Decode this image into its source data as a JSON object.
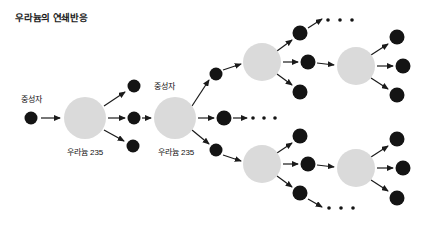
{
  "figure": {
    "title": "우라늄의 연쇄반응",
    "type": "diagram",
    "background_color": "#ffffff",
    "nucleus_color": "#d9d9d9",
    "neutron_color": "#1a1a1a",
    "arrow_color": "#1a1a1a",
    "text_color": "#111111"
  },
  "labels": {
    "neutron_left": "중성자",
    "neutron_top": "중성자",
    "uranium_1": "우라늄 235",
    "uranium_2": "우라늄 235",
    "ellipsis": "· · ·"
  },
  "diagram_data": {
    "generations": 4,
    "branching_factor": 3,
    "nuclei": [
      {
        "id": "u1",
        "cx": 85,
        "cy": 118,
        "r": 21,
        "label": "우라늄 235",
        "label_x": 85,
        "label_y": 152
      },
      {
        "id": "u2",
        "cx": 175,
        "cy": 118,
        "r": 21,
        "label": "우라늄 235",
        "label_x": 175,
        "label_y": 152
      },
      {
        "id": "u3",
        "cx": 262,
        "cy": 62,
        "r": 19,
        "label": "",
        "label_x": 0,
        "label_y": 0
      },
      {
        "id": "u4",
        "cx": 262,
        "cy": 164,
        "r": 19,
        "label": "",
        "label_x": 0,
        "label_y": 0
      },
      {
        "id": "u5",
        "cx": 356,
        "cy": 66,
        "r": 19,
        "label": "",
        "label_x": 0,
        "label_y": 0
      },
      {
        "id": "u6",
        "cx": 356,
        "cy": 168,
        "r": 19,
        "label": "",
        "label_x": 0,
        "label_y": 0
      }
    ],
    "neutrons": [
      {
        "id": "n0",
        "cx": 31,
        "cy": 118,
        "r": 6.5
      },
      {
        "id": "n1",
        "cx": 134,
        "cy": 86,
        "r": 6.5
      },
      {
        "id": "n2",
        "cx": 134,
        "cy": 118,
        "r": 6.5
      },
      {
        "id": "n3",
        "cx": 134,
        "cy": 146,
        "r": 6.5
      },
      {
        "id": "n4",
        "cx": 216,
        "cy": 74,
        "r": 6.5
      },
      {
        "id": "n5",
        "cx": 224,
        "cy": 118,
        "r": 7.5
      },
      {
        "id": "n6",
        "cx": 216,
        "cy": 150,
        "r": 6.5
      },
      {
        "id": "n7",
        "cx": 300,
        "cy": 33,
        "r": 7.5
      },
      {
        "id": "n8",
        "cx": 308,
        "cy": 62,
        "r": 7.5
      },
      {
        "id": "n9",
        "cx": 300,
        "cy": 92,
        "r": 7.5
      },
      {
        "id": "n10",
        "cx": 300,
        "cy": 136,
        "r": 7.5
      },
      {
        "id": "n11",
        "cx": 308,
        "cy": 164,
        "r": 7.5
      },
      {
        "id": "n12",
        "cx": 300,
        "cy": 193,
        "r": 7.5
      },
      {
        "id": "n13",
        "cx": 397,
        "cy": 37,
        "r": 7.5
      },
      {
        "id": "n14",
        "cx": 403,
        "cy": 66,
        "r": 7.5
      },
      {
        "id": "n15",
        "cx": 397,
        "cy": 95,
        "r": 7.5
      },
      {
        "id": "n16",
        "cx": 397,
        "cy": 139,
        "r": 7.5
      },
      {
        "id": "n17",
        "cx": 403,
        "cy": 168,
        "r": 7.5
      },
      {
        "id": "n18",
        "cx": 397,
        "cy": 198,
        "r": 7.5
      }
    ],
    "ellipses_groups": [
      {
        "id": "e-top",
        "x": 327,
        "y": 22,
        "count": 3
      },
      {
        "id": "e-mid",
        "x": 252,
        "y": 118,
        "count": 3
      },
      {
        "id": "e-bottom-mid",
        "x": 252,
        "y": 118,
        "count": 0
      },
      {
        "id": "e-lower",
        "x": 327,
        "y": 205,
        "count": 3
      }
    ],
    "arrows": [
      {
        "from": "n0",
        "to": "u1",
        "x1": 41,
        "y1": 118,
        "x2": 62,
        "y2": 118
      },
      {
        "from": "u1",
        "to": "n1",
        "x1": 103,
        "y1": 105,
        "x2": 126,
        "y2": 91
      },
      {
        "from": "u1",
        "to": "n2",
        "x1": 108,
        "y1": 118,
        "x2": 126,
        "y2": 118
      },
      {
        "from": "u1",
        "to": "n3",
        "x1": 103,
        "y1": 131,
        "x2": 124,
        "y2": 142
      },
      {
        "from": "n2",
        "to": "u2",
        "x1": 142,
        "y1": 118,
        "x2": 152,
        "y2": 118
      },
      {
        "from": "u2",
        "to": "n4",
        "x1": 192,
        "y1": 106,
        "x2": 209,
        "y2": 79
      },
      {
        "from": "u2",
        "to": "n5",
        "x1": 197,
        "y1": 118,
        "x2": 215,
        "y2": 118
      },
      {
        "from": "u2",
        "to": "n6",
        "x1": 192,
        "y1": 131,
        "x2": 209,
        "y2": 145
      },
      {
        "from": "n4",
        "to": "u3",
        "x1": 223,
        "y1": 70,
        "x2": 242,
        "y2": 64
      },
      {
        "from": "n6",
        "to": "u4",
        "x1": 223,
        "y1": 155,
        "x2": 242,
        "y2": 162
      },
      {
        "from": "n5",
        "to": "e-mid",
        "x1": 233,
        "y1": 118,
        "x2": 248,
        "y2": 118
      },
      {
        "from": "u3",
        "to": "n7",
        "x1": 277,
        "y1": 50,
        "x2": 292,
        "y2": 39
      },
      {
        "from": "u3",
        "to": "n8",
        "x1": 283,
        "y1": 62,
        "x2": 299,
        "y2": 62
      },
      {
        "from": "u3",
        "to": "n9",
        "x1": 277,
        "y1": 75,
        "x2": 292,
        "y2": 86
      },
      {
        "from": "n7",
        "to": "e-top",
        "x1": 308,
        "y1": 28,
        "x2": 322,
        "y2": 20
      },
      {
        "from": "n8",
        "to": "u5",
        "x1": 317,
        "y1": 62,
        "x2": 335,
        "y2": 65
      },
      {
        "from": "u4",
        "to": "n10",
        "x1": 277,
        "y1": 152,
        "x2": 292,
        "y2": 142
      },
      {
        "from": "u4",
        "to": "n11",
        "x1": 283,
        "y1": 164,
        "x2": 299,
        "y2": 164
      },
      {
        "from": "u4",
        "to": "n12",
        "x1": 277,
        "y1": 177,
        "x2": 292,
        "y2": 188
      },
      {
        "from": "n11",
        "to": "u6",
        "x1": 317,
        "y1": 164,
        "x2": 335,
        "y2": 167
      },
      {
        "from": "n12",
        "to": "e-lower",
        "x1": 308,
        "y1": 199,
        "x2": 322,
        "y2": 206
      },
      {
        "from": "u5",
        "to": "n13",
        "x1": 371,
        "y1": 54,
        "x2": 389,
        "y2": 43
      },
      {
        "from": "u5",
        "to": "n14",
        "x1": 377,
        "y1": 66,
        "x2": 394,
        "y2": 66
      },
      {
        "from": "u5",
        "to": "n15",
        "x1": 371,
        "y1": 79,
        "x2": 389,
        "y2": 90
      },
      {
        "from": "u6",
        "to": "n16",
        "x1": 371,
        "y1": 156,
        "x2": 389,
        "y2": 145
      },
      {
        "from": "u6",
        "to": "n17",
        "x1": 377,
        "y1": 168,
        "x2": 394,
        "y2": 168
      },
      {
        "from": "u6",
        "to": "n18",
        "x1": 371,
        "y1": 181,
        "x2": 389,
        "y2": 192
      }
    ],
    "label_positions": {
      "neutron_left": {
        "x": 31,
        "y": 103
      },
      "neutron_top": {
        "x": 153,
        "y": 89
      },
      "uranium_1": {
        "x": 85,
        "y": 152
      },
      "uranium_2": {
        "x": 175,
        "y": 152
      }
    }
  }
}
